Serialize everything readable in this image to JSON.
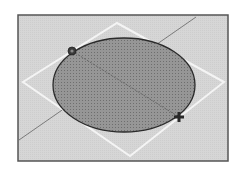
{
  "viewport": {
    "description": "3D modeling viewport showing an elliptical disc face on a rotated square with an axis line",
    "frame": {
      "x": 18,
      "y": 15,
      "width": 210,
      "height": 146
    },
    "colors": {
      "page_background": "#ffffff",
      "viewport_background": "#d4d4d4",
      "frame_border": "#555555",
      "ellipse_fill": "#8c8c8c",
      "ellipse_stroke": "#2a2a2a",
      "diamond_stroke": "#f4f4f4",
      "axis_line": "#7a7a7a",
      "inner_line": "#5a5a5a",
      "handle": "#333333"
    }
  },
  "scene": {
    "diamond": {
      "points": [
        [
          117,
          23
        ],
        [
          224,
          82
        ],
        [
          130,
          156
        ],
        [
          23,
          82
        ]
      ],
      "icon": "rotated-square-outline"
    },
    "ellipse": {
      "cx": 124,
      "cy": 85,
      "rx": 71,
      "ry": 47,
      "texture": "dotted-fill"
    },
    "axis_line": {
      "x1": 19,
      "y1": 140,
      "x2": 196,
      "y2": 17
    },
    "inner_line": {
      "x1": 72,
      "y1": 51,
      "x2": 179,
      "y2": 117
    },
    "handles": [
      {
        "name": "start-point-handle",
        "x": 72,
        "y": 51,
        "icon": "circle-point-icon"
      },
      {
        "name": "end-point-handle",
        "x": 179,
        "y": 117,
        "icon": "move-cross-icon"
      }
    ]
  }
}
